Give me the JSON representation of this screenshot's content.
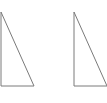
{
  "diagram": {
    "type": "geometry",
    "stroke_color": "#7a7a7a",
    "stroke_width": 1,
    "shapes": [
      {
        "name": "right-triangle-left",
        "kind": "right-triangle",
        "points": [
          [
            1,
            12
          ],
          [
            1,
            86
          ],
          [
            34,
            86
          ]
        ]
      },
      {
        "name": "right-triangle-right",
        "kind": "right-triangle",
        "points": [
          [
            74,
            12
          ],
          [
            74,
            86
          ],
          [
            107,
            86
          ]
        ]
      }
    ]
  }
}
